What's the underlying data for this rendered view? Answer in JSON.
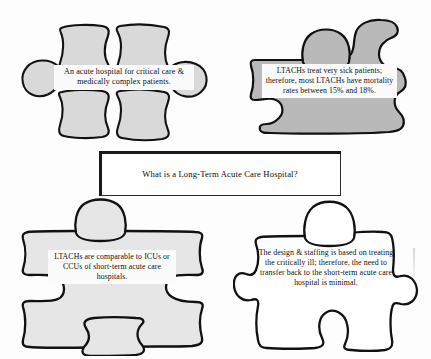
{
  "document": {
    "title": "What is a Long-Term Acute Care Hospital?",
    "type": "puzzle-diagram"
  },
  "center": {
    "question": "What is a Long-Term Acute Care Hospital?"
  },
  "pieces": [
    {
      "id": "top-left",
      "position": "top-left",
      "fill_color": "#d9d9d9",
      "outline_color": "#121212",
      "style": "filled-light-gray",
      "text": "An acute hospital for critical care & medically complex patients."
    },
    {
      "id": "top-right",
      "position": "top-right",
      "fill_color": "#b9b9b9",
      "outline_color": "#101010",
      "style": "filled-medium-gray",
      "text": "LTACHs treat very sick patients; therefore, most LTACHs have mortality rates between 15% and 18%."
    },
    {
      "id": "bottom-left",
      "position": "bottom-left",
      "fill_color": "#e6e6e6",
      "outline_color": "#111111",
      "style": "filled-pale-gray",
      "text": "LTACHs are comparable to ICUs or CCUs of short-term acute care hospitals."
    },
    {
      "id": "bottom-right",
      "position": "bottom-right",
      "fill_color": "#ffffff",
      "outline_color": "#111111",
      "style": "outline-only",
      "text": "The design & staffing is based on treating the critically ill; therefore, the need to transfer back to the short-term acute care hospital is minimal."
    }
  ]
}
